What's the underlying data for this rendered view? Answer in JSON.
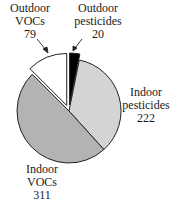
{
  "chart_data": {
    "type": "pie",
    "title": "",
    "total": 632,
    "slices": [
      {
        "label": "Outdoor pesticides",
        "value": 20,
        "color": "#000000",
        "exploded": true
      },
      {
        "label": "Indoor pesticides",
        "value": 222,
        "color": "#d4d4d4",
        "exploded": false
      },
      {
        "label": "Indoor VOCs",
        "value": 311,
        "color": "#b3b3b3",
        "exploded": false
      },
      {
        "label": "Outdoor VOCs",
        "value": 79,
        "color": "#ffffff",
        "exploded": true
      }
    ],
    "start_angle": "top (12 o'clock)",
    "direction": "clockwise",
    "legend": "none (direct labels)"
  },
  "labels": {
    "outdoor_vocs": {
      "line1": "Outdoor",
      "line2": "VOCs",
      "value": "79"
    },
    "outdoor_pesticides": {
      "line1": "Outdoor",
      "line2": "pesticides",
      "value": "20"
    },
    "indoor_pesticides": {
      "line1": "Indoor",
      "line2": "pesticides",
      "value": "222"
    },
    "indoor_vocs": {
      "line1": "Indoor",
      "line2": "VOCs",
      "value": "311"
    }
  }
}
